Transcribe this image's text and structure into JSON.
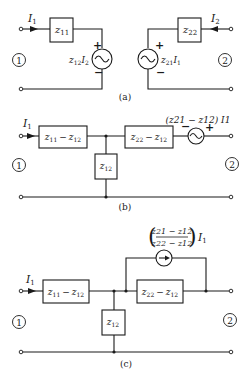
{
  "figure": {
    "panels": [
      {
        "id": "a",
        "caption": "(a)",
        "port1": {
          "label": "1",
          "current": "I",
          "current_sub": "1"
        },
        "port2": {
          "label": "2",
          "current": "I",
          "current_sub": "2"
        },
        "z11": {
          "main": "z",
          "sub": "11"
        },
        "z22": {
          "main": "z",
          "sub": "22"
        },
        "src1": {
          "label": "z",
          "label_sub": "12",
          "label_var": "I",
          "label_var_sub": "2",
          "plus": "+",
          "minus": "−"
        },
        "src2": {
          "label": "z",
          "label_sub": "21",
          "label_var": "I",
          "label_var_sub": "1",
          "plus": "+",
          "minus": "−"
        }
      },
      {
        "id": "b",
        "caption": "(b)",
        "port1": {
          "label": "1",
          "current": "I",
          "current_sub": "1"
        },
        "port2": {
          "label": "2"
        },
        "series1": {
          "text": "z11 − z12",
          "a": "z",
          "a_sub": "11",
          "op": "−",
          "b": "z",
          "b_sub": "12"
        },
        "shunt": {
          "main": "z",
          "sub": "12"
        },
        "series2": {
          "text": "z22 − z12",
          "a": "z",
          "a_sub": "22",
          "op": "−",
          "b": "z",
          "b_sub": "12"
        },
        "source": {
          "label": "(z21 − z12) I1",
          "plus": "+",
          "minus": "−"
        }
      },
      {
        "id": "c",
        "caption": "(c)",
        "port1": {
          "label": "1",
          "current": "I",
          "current_sub": "1"
        },
        "port2": {
          "label": "2"
        },
        "series1": {
          "text": "z11 − z12",
          "a": "z",
          "a_sub": "11",
          "op": "−",
          "b": "z",
          "b_sub": "12"
        },
        "shunt": {
          "main": "z",
          "sub": "12"
        },
        "series2": {
          "text": "z22 − z12",
          "a": "z",
          "a_sub": "22",
          "op": "−",
          "b": "z",
          "b_sub": "12"
        },
        "current_source": {
          "numerator": "z21 − z12",
          "denominator": "z22 − z12",
          "multiplier": "I",
          "multiplier_sub": "1"
        }
      }
    ]
  }
}
